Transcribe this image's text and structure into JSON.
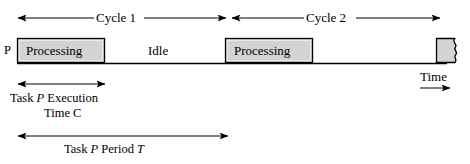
{
  "figure": {
    "title_text": "Task timing diagram",
    "process_label": "P",
    "cycles": [
      {
        "name": "cycle-1",
        "label": "Cycle 1"
      },
      {
        "name": "cycle-2",
        "label": "Cycle 2"
      }
    ],
    "timeline_segments": [
      {
        "name": "processing-1",
        "label": "Processing",
        "kind": "processing"
      },
      {
        "name": "idle-1",
        "label": "Idle",
        "kind": "idle"
      },
      {
        "name": "processing-2",
        "label": "Processing",
        "kind": "processing"
      },
      {
        "name": "idle-2",
        "label": "",
        "kind": "idle"
      },
      {
        "name": "processing-3",
        "label": "",
        "kind": "processing-truncated"
      }
    ],
    "axis": {
      "time_label": "Time"
    },
    "annotations": {
      "execution_line1_prefix": "Task ",
      "execution_line1_var": "P",
      "execution_line1_suffix": " Execution",
      "execution_line2": "Time C",
      "period_prefix": "Task ",
      "period_var1": "P",
      "period_mid": " Period ",
      "period_var2": "T"
    },
    "colors": {
      "box_fill": "#d3d3d3",
      "box_stroke": "#000000",
      "line": "#000000",
      "background": "#ffffff"
    }
  }
}
